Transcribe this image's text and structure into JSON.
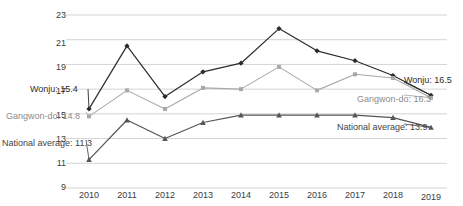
{
  "chart_data": {
    "type": "line",
    "title": "",
    "subtitle": "",
    "xlabel": "",
    "ylabel": "",
    "categories": [
      "2010",
      "2011",
      "2012",
      "2013",
      "2014",
      "2015",
      "2016",
      "2017",
      "2018",
      "2019"
    ],
    "x": [
      2010,
      2011,
      2012,
      2013,
      2014,
      2015,
      2016,
      2017,
      2018,
      2019
    ],
    "ylim": [
      9,
      23
    ],
    "yticks": [
      9,
      11,
      13,
      15,
      17,
      19,
      21,
      23
    ],
    "ytick_labels": [
      "9",
      "11",
      "13",
      "15",
      "17",
      "19",
      "21",
      "23"
    ],
    "grid": true,
    "grid_axis": "y",
    "legend": "none",
    "legend_position": "inline-annotations",
    "series": [
      {
        "name": "Wonju",
        "color": "#2b2b2b",
        "marker": "diamond",
        "values": [
          15.4,
          20.5,
          16.4,
          18.4,
          19.1,
          21.9,
          20.1,
          19.3,
          18.1,
          16.5
        ]
      },
      {
        "name": "Gangwon-do",
        "color": "#a8a8a8",
        "marker": "square",
        "values": [
          14.8,
          16.9,
          15.4,
          17.1,
          17.0,
          18.8,
          16.9,
          18.2,
          17.9,
          16.3
        ]
      },
      {
        "name": "National average",
        "color": "#555555",
        "marker": "triangle",
        "values": [
          11.3,
          14.5,
          13.0,
          14.3,
          14.9,
          14.9,
          14.9,
          14.9,
          14.7,
          13.9
        ]
      }
    ],
    "annotations": [
      {
        "id": "wonju-start",
        "text": "Wonju: 15.4",
        "series": "Wonju",
        "x": 2010,
        "y": 15.4,
        "color": "#2b2b2b"
      },
      {
        "id": "gangwon-start",
        "text": "Gangwon-do: 14.8",
        "series": "Gangwon-do",
        "x": 2010,
        "y": 14.8,
        "color": "#8c8c8c"
      },
      {
        "id": "national-start",
        "text": "National average: 11.3",
        "series": "National average",
        "x": 2010,
        "y": 11.3,
        "color": "#434343"
      },
      {
        "id": "wonju-end",
        "text": "Wonju: 16.5",
        "series": "Wonju",
        "x": 2019,
        "y": 16.5,
        "color": "#2b2b2b"
      },
      {
        "id": "gangwon-end",
        "text": "Gangwon-do: 16.3",
        "series": "Gangwon-do",
        "x": 2019,
        "y": 16.3,
        "color": "#8c8c8c"
      },
      {
        "id": "national-end",
        "text": "National average: 13.9",
        "series": "National average",
        "x": 2019,
        "y": 13.9,
        "color": "#434343"
      }
    ]
  },
  "axis": {
    "y_ticks": [
      "23",
      "21",
      "19",
      "17",
      "15",
      "13",
      "11",
      "9"
    ],
    "x_ticks": [
      "2010",
      "2011",
      "2012",
      "2013",
      "2014",
      "2015",
      "2016",
      "2017",
      "2018",
      "2019"
    ]
  },
  "annotations": {
    "wonju_start": "Wonju: 15.4",
    "gangwon_start": "Gangwon-do: 14.8",
    "national_start": "National average: 11.3",
    "wonju_end": "Wonju: 16.5",
    "gangwon_end": "Gangwon-do: 16.3",
    "national_end": "National average: 13.9"
  },
  "colors": {
    "wonju": "#2b2b2b",
    "gangwon": "#a8a8a8",
    "national": "#555555",
    "grid": "#d4d4d4",
    "text": "#3b3b3b",
    "background": "#ffffff"
  }
}
